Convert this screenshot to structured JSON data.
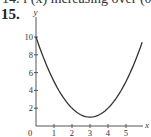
{
  "header": {
    "previous_line": "14. f′(x) increasing over (0, 2)",
    "problem_number": "15."
  },
  "chart_data": {
    "type": "line",
    "title": "",
    "xlabel": "x",
    "ylabel": "y",
    "xlim": [
      0,
      6
    ],
    "ylim": [
      0,
      10.5
    ],
    "x_ticks": [
      0,
      1,
      2,
      3,
      4,
      5
    ],
    "x_tick_labels": [
      "0",
      "1",
      "2",
      "3",
      "4",
      "5"
    ],
    "y_ticks": [
      2,
      4,
      6,
      8,
      10
    ],
    "y_tick_labels": [
      "2",
      "4",
      "6",
      "8",
      "10"
    ],
    "grid": false,
    "legend": null,
    "series": [
      {
        "name": "y = (x - 3)^2 + 1",
        "x": [
          0,
          0.5,
          1,
          1.5,
          2,
          2.5,
          3,
          3.5,
          4,
          4.5,
          5,
          5.5,
          5.9
        ],
        "y": [
          10,
          7.25,
          5,
          3.25,
          2,
          1.25,
          1,
          1.25,
          2,
          3.25,
          5,
          7.25,
          9.41
        ]
      }
    ],
    "annotations": [
      {
        "text": "minimum",
        "x": 3,
        "y": 1
      }
    ],
    "style": {
      "curve_color": "#333333",
      "axis_color": "#555555"
    }
  }
}
